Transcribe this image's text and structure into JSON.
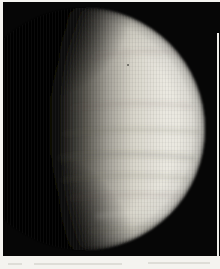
{
  "image": {
    "kind": "photograph",
    "subject": "Venus",
    "alt": "Gibbous disc of the planet Venus, pale cream cloud tops sunlit from the right, fading into shadow on the left against black space, framed by a white scan border",
    "colors": {
      "page_background": "#f4f3ef",
      "photo_background": "#060606",
      "planet_bright": "#eae8e0",
      "planet_mid": "#a6a39a",
      "planet_terminator": "#000000",
      "cloud_band": "#55534a",
      "scan_smudge": "#d9d8d2",
      "border_strip": "#f1f0ec"
    }
  }
}
